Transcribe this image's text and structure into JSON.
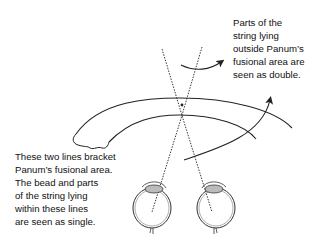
{
  "diagram": {
    "type": "Panum's fusional area illustration",
    "annotations": {
      "top_right": {
        "lines": [
          "Parts of the",
          "string lying",
          "outside Panum’s",
          "fusional area are",
          "seen as double."
        ]
      },
      "bottom_left": {
        "lines": [
          "These two lines bracket",
          "Panum’s fusional area.",
          "The bead and parts",
          "of the string lying",
          "within these lines",
          "are seen as single."
        ]
      }
    },
    "elements": [
      "outer-arc",
      "inner-arc",
      "left-eye",
      "right-eye",
      "left-sight-line",
      "right-sight-line",
      "arrow-upper",
      "arrow-lower",
      "bead-intersection"
    ],
    "colors": {
      "stroke": "#222222",
      "text": "#111111",
      "background": "#ffffff"
    }
  }
}
